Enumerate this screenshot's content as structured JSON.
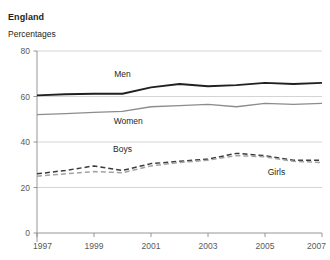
{
  "header": {
    "region_title": "England",
    "units_label": "Percentages"
  },
  "chart_data": {
    "type": "line",
    "title": "England",
    "subtitle": "Percentages",
    "xlabel": "",
    "ylabel": "Percentages",
    "x": [
      1997,
      1998,
      1999,
      2000,
      2001,
      2002,
      2003,
      2004,
      2005,
      2006,
      2007
    ],
    "xtick_labels": [
      "1997",
      "1999",
      "2001",
      "2003",
      "2005",
      "2007"
    ],
    "xticks": [
      1997,
      1999,
      2001,
      2003,
      2005,
      2007
    ],
    "xlim": [
      1997,
      2007
    ],
    "ytick_labels": [
      "0",
      "20",
      "40",
      "60",
      "80"
    ],
    "yticks": [
      0,
      20,
      40,
      60,
      80
    ],
    "ylim": [
      0,
      80
    ],
    "grid": "horizontal",
    "legend": "inline-labels",
    "series": [
      {
        "name": "Men",
        "label": "Men",
        "style": "solid",
        "color": "#231f20",
        "width": 1.9,
        "label_x": 2000.0,
        "label_y": 68.5,
        "values": [
          60.5,
          61.0,
          61.2,
          61.2,
          64.0,
          65.5,
          64.5,
          65.0,
          66.0,
          65.5,
          66.0
        ]
      },
      {
        "name": "Women",
        "label": "Women",
        "style": "solid",
        "color": "#8c8c8c",
        "width": 1.3,
        "label_x": 2000.2,
        "label_y": 48.0,
        "values": [
          52.0,
          52.5,
          53.0,
          53.5,
          55.5,
          56.0,
          56.5,
          55.5,
          57.0,
          56.5,
          57.0
        ]
      },
      {
        "name": "Boys",
        "label": "Boys",
        "style": "dashed",
        "color": "#3b3b3b",
        "width": 1.5,
        "label_x": 2000.0,
        "label_y": 35.5,
        "values": [
          26.0,
          27.5,
          29.5,
          27.5,
          30.5,
          31.5,
          32.5,
          35.0,
          34.0,
          32.0,
          32.0
        ]
      },
      {
        "name": "Girls",
        "label": "Girls",
        "style": "dashed",
        "color": "#a3a3a3",
        "width": 1.5,
        "label_x": 2005.4,
        "label_y": 25.5,
        "values": [
          25.0,
          26.0,
          27.0,
          26.5,
          29.5,
          31.0,
          32.0,
          34.0,
          33.5,
          31.5,
          31.0
        ]
      }
    ]
  },
  "colors": {
    "grid": "#c9c9c9",
    "axis": "#8a8a8a",
    "text": "#231f20",
    "tick_text": "#58595b",
    "background": "#ffffff"
  }
}
